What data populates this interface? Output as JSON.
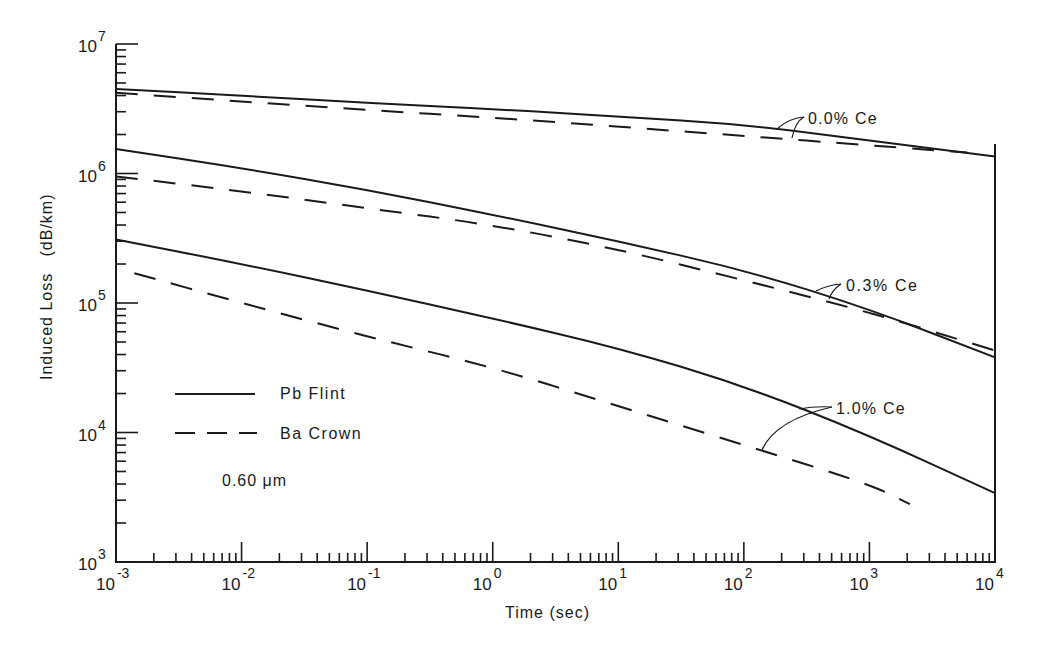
{
  "chart_data": {
    "type": "line",
    "title": "",
    "xlabel": "Time (sec)",
    "ylabel": "Induced Loss   (dB/km)",
    "xscale": "log",
    "yscale": "log",
    "xlim": [
      0.001,
      10000
    ],
    "ylim": [
      1000,
      10000000
    ],
    "x_tick_labels": [
      {
        "base": "10",
        "exp": "-3",
        "value": 0.001
      },
      {
        "base": "10",
        "exp": "-2",
        "value": 0.01
      },
      {
        "base": "10",
        "exp": "-1",
        "value": 0.1
      },
      {
        "base": "10",
        "exp": "0",
        "value": 1
      },
      {
        "base": "10",
        "exp": "1",
        "value": 10
      },
      {
        "base": "10",
        "exp": "2",
        "value": 100
      },
      {
        "base": "10",
        "exp": "3",
        "value": 1000
      },
      {
        "base": "10",
        "exp": "4",
        "value": 10000
      }
    ],
    "y_tick_labels": [
      {
        "base": "10",
        "exp": "3",
        "value": 1000
      },
      {
        "base": "10",
        "exp": "4",
        "value": 10000
      },
      {
        "base": "10",
        "exp": "5",
        "value": 100000
      },
      {
        "base": "10",
        "exp": "6",
        "value": 1000000
      },
      {
        "base": "10",
        "exp": "7",
        "value": 10000000
      }
    ],
    "grid": false,
    "legend": {
      "position": "lower-left inside",
      "entries": [
        {
          "label": "Pb Flint",
          "style": "solid"
        },
        {
          "label": "Ba Crown",
          "style": "dashed"
        }
      ]
    },
    "annotations": [
      {
        "text": "0.60 μm",
        "role": "wavelength"
      },
      {
        "text": "0.0% Ce",
        "role": "curve-pair label"
      },
      {
        "text": "0.3% Ce",
        "role": "curve-pair label"
      },
      {
        "text": "1.0% Ce",
        "role": "curve-pair label"
      }
    ],
    "series": [
      {
        "name": "Pb Flint, 0.0% Ce",
        "glass": "Pb Flint",
        "ce": "0.0% Ce",
        "style": "solid",
        "x": [
          0.001,
          0.01,
          0.1,
          1,
          10,
          100,
          1000,
          10000
        ],
        "y": [
          4500000,
          4000000,
          3500000,
          3150000,
          2750000,
          2400000,
          1800000,
          1350000
        ]
      },
      {
        "name": "Ba Crown, 0.0% Ce",
        "glass": "Ba Crown",
        "ce": "0.0% Ce",
        "style": "dashed",
        "x": [
          0.001,
          0.01,
          0.1,
          1,
          10,
          100,
          1000,
          6000
        ],
        "y": [
          4200000,
          3600000,
          3100000,
          2700000,
          2300000,
          1950000,
          1650000,
          1450000
        ]
      },
      {
        "name": "Pb Flint, 0.3% Ce",
        "glass": "Pb Flint",
        "ce": "0.3% Ce",
        "style": "solid",
        "x": [
          0.001,
          0.01,
          0.1,
          1,
          10,
          100,
          1000,
          10000
        ],
        "y": [
          1550000,
          1100000,
          750000,
          480000,
          300000,
          180000,
          90000,
          38000
        ]
      },
      {
        "name": "Ba Crown, 0.3% Ce",
        "glass": "Ba Crown",
        "ce": "0.3% Ce",
        "style": "dashed",
        "x": [
          0.001,
          0.01,
          0.1,
          1,
          10,
          100,
          1000,
          10000
        ],
        "y": [
          950000,
          730000,
          540000,
          400000,
          260000,
          150000,
          85000,
          43000
        ]
      },
      {
        "name": "Pb Flint, 1.0% Ce",
        "glass": "Pb Flint",
        "ce": "1.0% Ce",
        "style": "solid",
        "x": [
          0.001,
          0.01,
          0.1,
          1,
          10,
          100,
          1000,
          10000
        ],
        "y": [
          310000,
          200000,
          125000,
          76000,
          45000,
          23000,
          9500,
          3400
        ]
      },
      {
        "name": "Ba Crown, 1.0% Ce",
        "glass": "Ba Crown",
        "ce": "1.0% Ce",
        "style": "dashed",
        "x": [
          0.0014,
          0.01,
          0.1,
          1,
          10,
          100,
          1000,
          2100
        ],
        "y": [
          170000,
          100000,
          55000,
          32000,
          16000,
          8000,
          4000,
          2800
        ]
      }
    ]
  }
}
